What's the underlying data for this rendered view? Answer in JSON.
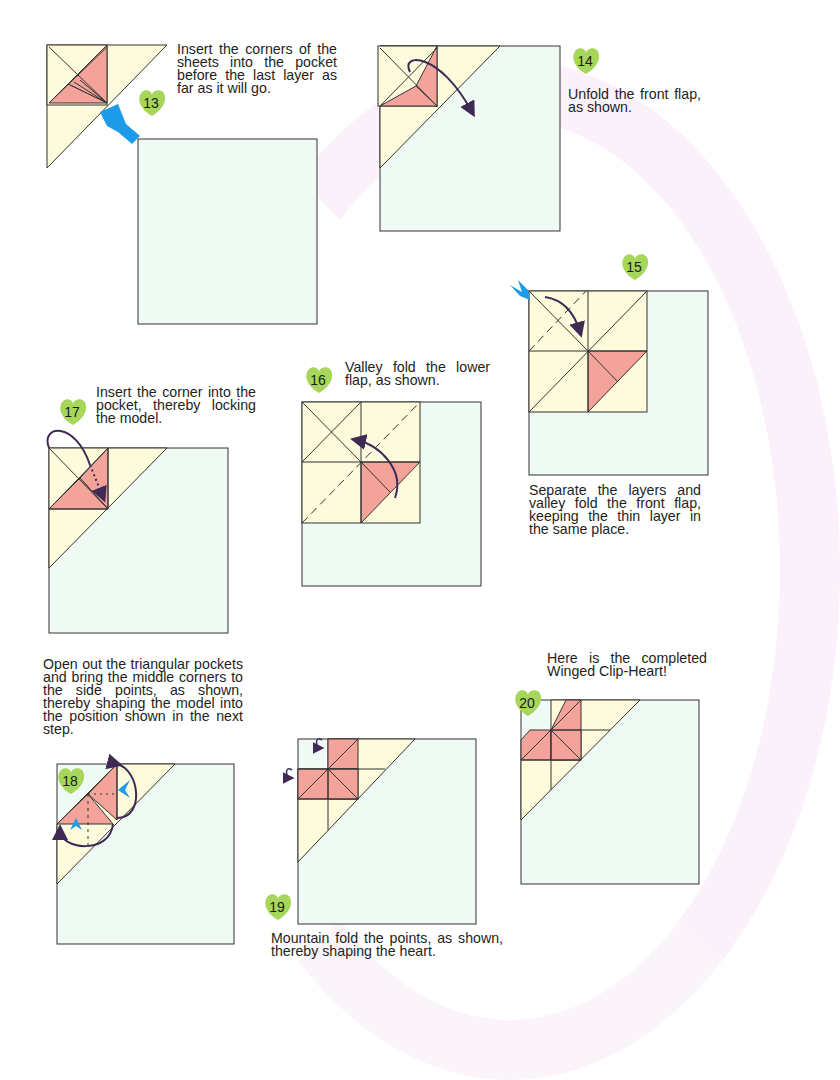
{
  "page": {
    "type": "origami instruction page",
    "model": "Winged Clip-Heart"
  },
  "colors": {
    "paper_front": "#fdfbdc",
    "paper_back": "#f0faf4",
    "pink_layer": "#f4a39a",
    "outline": "#333333",
    "arrow": "#3f2a55",
    "blue_pointer": "#1d9be6",
    "badge_green": "#9fd456"
  },
  "steps": [
    {
      "number": "13",
      "text": "Insert the corners of the sheets into the pocket before the last layer as far as it will go."
    },
    {
      "number": "14",
      "text": "Unfold the front flap, as shown."
    },
    {
      "number": "15",
      "text": "Separate the layers and valley fold the front flap, keeping the thin layer in the same place."
    },
    {
      "number": "16",
      "text": "Valley fold the lower flap, as shown."
    },
    {
      "number": "17",
      "text": "Insert the corner into the pocket, thereby locking the model."
    },
    {
      "number": "18",
      "text": "Open out the triangular pockets and bring the middle corners to the side points, as shown, thereby shaping the model into the position shown in the next step."
    },
    {
      "number": "19",
      "text": "Mountain fold the points, as shown, thereby shaping the heart."
    },
    {
      "number": "20",
      "text": "Here is the completed Winged Clip-Heart!"
    }
  ]
}
